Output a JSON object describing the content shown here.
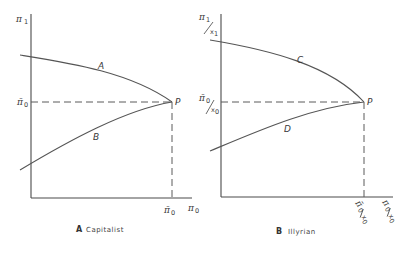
{
  "panels": [
    {
      "id": "A",
      "caption_letter": "A",
      "caption_text": "Capitalist",
      "y_axis_label": "π",
      "y_axis_sub": "1",
      "x_axis_label": "π",
      "x_axis_sub": "0",
      "y_tick_label": "π̄",
      "y_tick_sub": "0",
      "x_tick_label": "π̄",
      "x_tick_sub": "0",
      "point_label": "P",
      "upper_curve_label": "A",
      "lower_curve_label": "B"
    },
    {
      "id": "B",
      "caption_letter": "B",
      "caption_text": "Illyrian",
      "y_axis_label": "π",
      "y_axis_sub": "1",
      "y_axis_den": "x",
      "y_axis_den_sub": "1",
      "x_axis_label": "π",
      "x_axis_sub": "0",
      "x_axis_den": "x",
      "x_axis_den_sub": "0",
      "y_tick_label": "π̄",
      "y_tick_sub": "0",
      "y_tick_den": "x",
      "y_tick_den_sub": "0",
      "x_tick_label": "π̄",
      "x_tick_sub": "0",
      "x_tick_den": "x",
      "x_tick_den_sub": "0",
      "point_label": "P",
      "upper_curve_label": "C",
      "lower_curve_label": "D"
    }
  ]
}
